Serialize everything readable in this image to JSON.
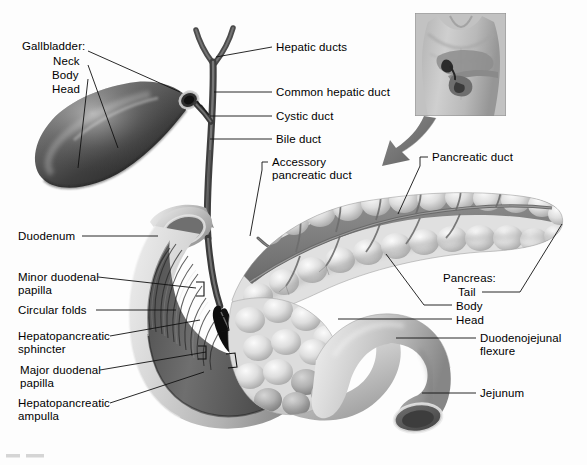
{
  "figure": {
    "background_color": "#fdfdfd",
    "text_color": "#000000",
    "leader_color": "#1a1a1a"
  },
  "inset": {
    "name": "orientation-inset",
    "description": "anterior torso with gallbladder, pancreas and duodenum in situ",
    "border_color": "#8d8d8d",
    "arrow_color": "#6e6e6e"
  },
  "labels_left": [
    {
      "id": "gallbladder-group",
      "text": "Gallbladder:",
      "x": 22,
      "y": 40
    },
    {
      "id": "gallbladder-neck",
      "text": "Neck",
      "x": 53,
      "y": 55
    },
    {
      "id": "gallbladder-body",
      "text": "Body",
      "x": 52,
      "y": 69
    },
    {
      "id": "gallbladder-head",
      "text": "Head",
      "x": 52,
      "y": 83
    },
    {
      "id": "duodenum",
      "text": "Duodenum",
      "x": 18,
      "y": 240
    },
    {
      "id": "minor-duodenal-papilla",
      "text": "Minor duodenal",
      "x": 18,
      "y": 281
    },
    {
      "id": "minor-duodenal-papilla-2",
      "text": "papilla",
      "x": 18,
      "y": 294
    },
    {
      "id": "circular-folds",
      "text": "Circular folds",
      "x": 18,
      "y": 314
    },
    {
      "id": "hepatopancreatic-sphincter",
      "text": "Hepatopancreatic",
      "x": 18,
      "y": 340
    },
    {
      "id": "hepatopancreatic-sphincter-2",
      "text": "sphincter",
      "x": 18,
      "y": 353
    },
    {
      "id": "major-duodenal-papilla",
      "text": "Major duodenal",
      "x": 20,
      "y": 374
    },
    {
      "id": "major-duodenal-papilla-2",
      "text": "papilla",
      "x": 20,
      "y": 387
    },
    {
      "id": "hepatopancreatic-ampulla",
      "text": "Hepatopancreatic",
      "x": 18,
      "y": 407
    },
    {
      "id": "hepatopancreatic-ampulla-2",
      "text": "ampulla",
      "x": 18,
      "y": 420
    }
  ],
  "labels_right": [
    {
      "id": "hepatic-ducts",
      "text": "Hepatic ducts",
      "x": 276,
      "y": 50
    },
    {
      "id": "common-hepatic-duct",
      "text": "Common hepatic duct",
      "x": 276,
      "y": 95
    },
    {
      "id": "cystic-duct",
      "text": "Cystic duct",
      "x": 276,
      "y": 119
    },
    {
      "id": "bile-duct",
      "text": "Bile duct",
      "x": 276,
      "y": 142
    },
    {
      "id": "accessory-pancreatic-duct",
      "text": "Accessory",
      "x": 272,
      "y": 165
    },
    {
      "id": "accessory-pancreatic-duct-2",
      "text": "pancreatic duct",
      "x": 272,
      "y": 178
    },
    {
      "id": "pancreatic-duct",
      "text": "Pancreatic duct",
      "x": 432,
      "y": 160
    },
    {
      "id": "pancreas-group",
      "text": "Pancreas:",
      "x": 443,
      "y": 281
    },
    {
      "id": "pancreas-tail",
      "text": "Tail",
      "x": 458,
      "y": 295
    },
    {
      "id": "pancreas-body",
      "text": "Body",
      "x": 456,
      "y": 309
    },
    {
      "id": "pancreas-head",
      "text": "Head",
      "x": 456,
      "y": 323
    },
    {
      "id": "duodenojejunal-flexure",
      "text": "Duodenojejunal",
      "x": 480,
      "y": 341
    },
    {
      "id": "duodenojejunal-flexure-2",
      "text": "flexure",
      "x": 480,
      "y": 354
    },
    {
      "id": "jejunum",
      "text": "Jejunum",
      "x": 480,
      "y": 396
    }
  ]
}
